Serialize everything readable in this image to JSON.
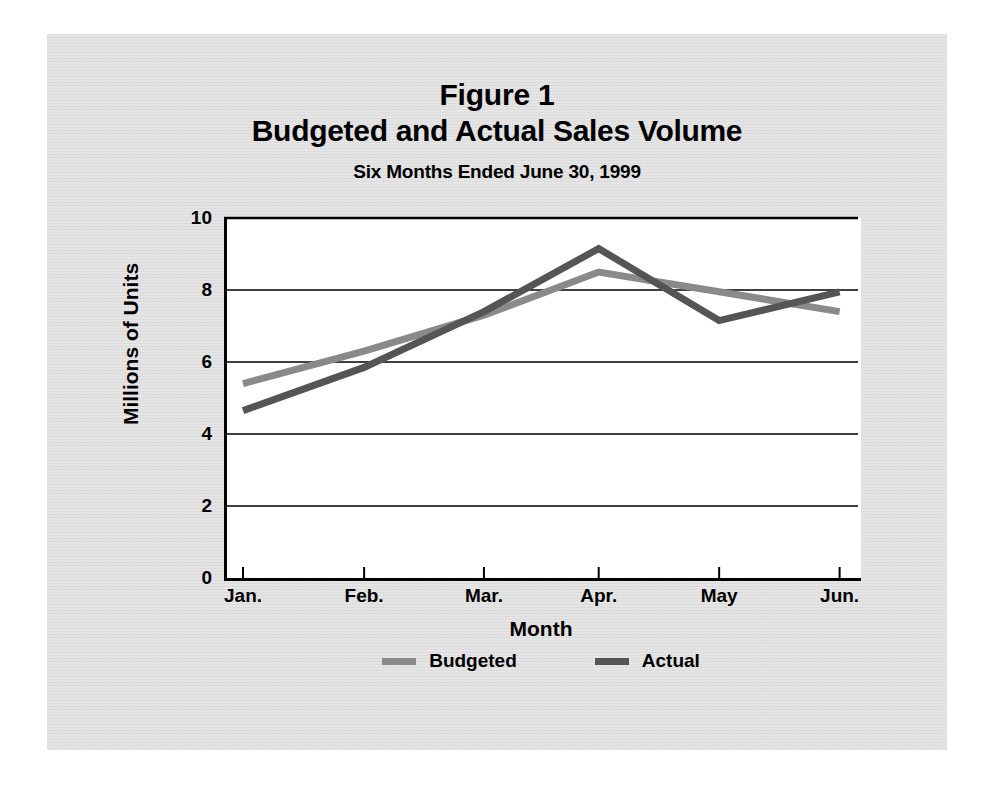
{
  "figure": {
    "title_line_1": "Figure 1",
    "title_line_2": "Budgeted and Actual Sales Volume",
    "subtitle": "Six Months Ended June 30, 1999"
  },
  "legend": {
    "position": "bottom-center",
    "entries": [
      {
        "label": "Budgeted",
        "color": "#8a8a8a"
      },
      {
        "label": "Actual",
        "color": "#555555"
      }
    ]
  },
  "colors": {
    "panel_background": "#dedede",
    "plot_background": "#ffffff",
    "axis": "#000000",
    "gridline": "#000000",
    "budgeted": "#8a8a8a",
    "actual": "#555555"
  },
  "chart_data": {
    "type": "line",
    "subtitle": "Six Months Ended June 30, 1999",
    "xlabel": "Month",
    "ylabel": "Millions of Units",
    "categories": [
      "Jan.",
      "Feb.",
      "Mar.",
      "Apr.",
      "May",
      "Jun."
    ],
    "series": [
      {
        "name": "Budgeted",
        "color": "#8a8a8a",
        "values": [
          5.4,
          6.3,
          7.3,
          8.5,
          7.95,
          7.4
        ]
      },
      {
        "name": "Actual",
        "color": "#555555",
        "values": [
          4.65,
          5.85,
          7.4,
          9.15,
          7.15,
          7.95
        ]
      }
    ],
    "ylim": [
      0,
      10
    ],
    "yticks": [
      0,
      2,
      4,
      6,
      8,
      10
    ],
    "ytick_labels": [
      "0",
      "2",
      "4",
      "6",
      "8",
      "10"
    ],
    "grid": true,
    "grid_axis": "y",
    "legend_position": "bottom-center"
  }
}
